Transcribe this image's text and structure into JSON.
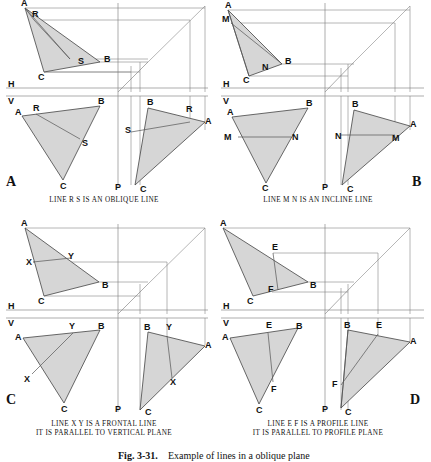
{
  "figure": {
    "number": "Fig. 3-31.",
    "caption": "Example of lines in a oblique plane",
    "fill_color": "#d6d6d6",
    "line_color": "#555555"
  },
  "panels": [
    {
      "id": "A",
      "key": "LINE R S IS AN OBLIQUE LINE",
      "caption_line2": "",
      "line_points": [
        "R",
        "S"
      ],
      "vertices": [
        "A",
        "B",
        "C"
      ],
      "axis_labels": {
        "horizontal": "H",
        "vertical": "V",
        "profile": "P"
      },
      "views": {
        "top": {
          "A": "A",
          "B": "B",
          "C": "C",
          "p1": "R",
          "p2": "S"
        },
        "front": {
          "A": "A",
          "B": "B",
          "C": "C",
          "p1": "R",
          "p2": "S"
        },
        "profile": {
          "A": "A",
          "B": "B",
          "C": "C",
          "p1": "R",
          "p2": "S"
        }
      }
    },
    {
      "id": "B",
      "key": "LINE M N IS AN INCLINE LINE",
      "caption_line2": "",
      "line_points": [
        "M",
        "N"
      ],
      "vertices": [
        "A",
        "B",
        "C"
      ],
      "axis_labels": {
        "horizontal": "H",
        "vertical": "V",
        "profile": "P"
      },
      "views": {
        "top": {
          "A": "A",
          "B": "B",
          "C": "C",
          "p1": "M",
          "p2": "N"
        },
        "front": {
          "A": "A",
          "B": "B",
          "C": "C",
          "p1": "M",
          "p2": "N"
        },
        "profile": {
          "A": "A",
          "B": "B",
          "C": "C",
          "p1": "M",
          "p2": "N"
        }
      }
    },
    {
      "id": "C",
      "key": "LINE X Y IS A FRONTAL LINE",
      "caption_line2": "IT IS PARALLEL TO VERTICAL PLANE",
      "line_points": [
        "X",
        "Y"
      ],
      "vertices": [
        "A",
        "B",
        "C"
      ],
      "axis_labels": {
        "horizontal": "H",
        "vertical": "V",
        "profile": "P"
      },
      "views": {
        "top": {
          "A": "A",
          "B": "B",
          "C": "C",
          "p1": "X",
          "p2": "Y"
        },
        "front": {
          "A": "A",
          "B": "B",
          "C": "C",
          "p1": "X",
          "p2": "Y"
        },
        "profile": {
          "A": "A",
          "B": "B",
          "C": "C",
          "p1": "X",
          "p2": "Y"
        }
      }
    },
    {
      "id": "D",
      "key": "LINE E F IS A PROFILE LINE",
      "caption_line2": "IT IS PARALLEL TO PROFILE PLANE",
      "line_points": [
        "E",
        "F"
      ],
      "vertices": [
        "A",
        "B",
        "C"
      ],
      "axis_labels": {
        "horizontal": "H",
        "vertical": "V",
        "profile": "P"
      },
      "views": {
        "top": {
          "A": "A",
          "B": "B",
          "C": "C",
          "p1": "E",
          "p2": "F"
        },
        "front": {
          "A": "A",
          "B": "B",
          "C": "C",
          "p1": "E",
          "p2": "F"
        },
        "profile": {
          "A": "A",
          "B": "B",
          "C": "C",
          "p1": "E",
          "p2": "F"
        }
      }
    }
  ]
}
